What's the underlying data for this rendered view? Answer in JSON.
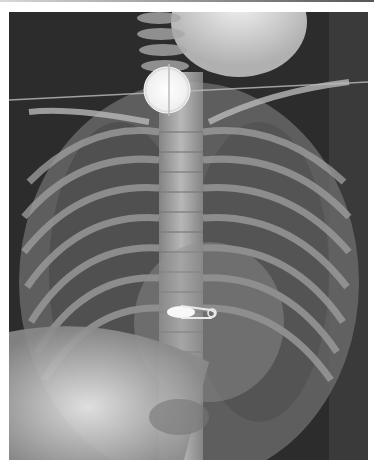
{
  "image": {
    "description": "Pediatric frontal chest X-ray showing a round coin-like radiopaque object at the level of the upper esophagus/neck and an open safety pin overlying the lower thoracic spine",
    "findings": [
      {
        "label": "coin-shaped foreign body",
        "location": "upper esophagus / thoracic inlet"
      },
      {
        "label": "safety pin foreign body",
        "location": "lower mediastinum, overlying spine"
      }
    ]
  }
}
